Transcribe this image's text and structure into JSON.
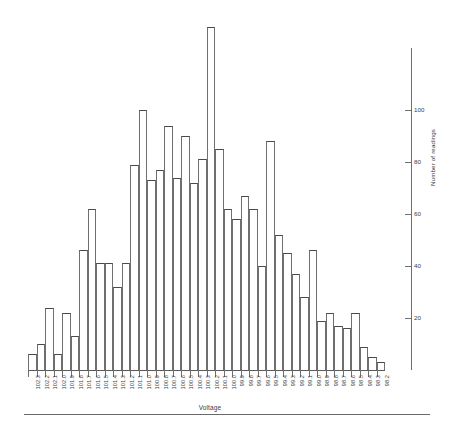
{
  "chart_data": {
    "type": "bar",
    "title": "",
    "subtitle": "",
    "xlabel": "Voltage",
    "ylabel": "Number of readings",
    "grid": false,
    "legend": null,
    "ylim": [
      0,
      135
    ],
    "yticks": [
      20,
      40,
      60,
      80,
      100
    ],
    "categories": [
      "102.3",
      "102.2",
      "102.1",
      "102.0",
      "101.9",
      "101.8",
      "101.7",
      "101.6",
      "101.5",
      "101.4",
      "101.3",
      "101.2",
      "101.1",
      "101.0",
      "100.9",
      "100.8",
      "100.7",
      "100.6",
      "100.5",
      "100.4",
      "100.3",
      "100.2",
      "100.1",
      "100.0",
      "99.9",
      "99.8",
      "99.7",
      "99.6",
      "99.5",
      "99.4",
      "99.3",
      "99.2",
      "99.1",
      "99.0",
      "98.9",
      "98.8",
      "98.7",
      "98.6",
      "98.5",
      "98.4",
      "98.3",
      "98.2"
    ],
    "values": [
      6,
      10,
      24,
      6,
      22,
      13,
      46,
      62,
      41,
      41,
      32,
      41,
      79,
      100,
      73,
      77,
      94,
      74,
      90,
      72,
      81,
      132,
      85,
      62,
      58,
      67,
      62,
      40,
      88,
      52,
      45,
      37,
      28,
      46,
      19,
      22,
      17,
      16,
      22,
      9,
      5,
      3
    ]
  },
  "axes": {
    "x_title": "Voltage",
    "y_title": "Number of readings",
    "y_tick_labels": [
      "20",
      "40",
      "60",
      "80",
      "100"
    ]
  }
}
